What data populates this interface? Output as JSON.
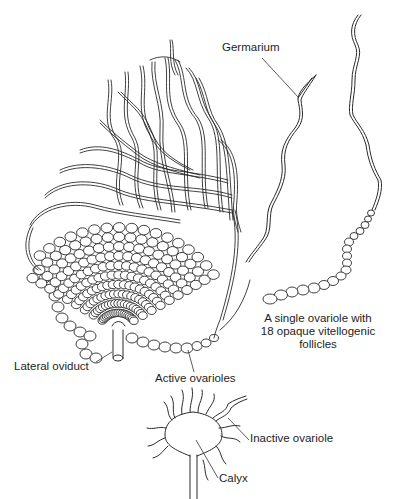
{
  "figure": {
    "type": "scientific-illustration",
    "ink_color": "#2a2a2a",
    "background": "#ffffff"
  },
  "labels": {
    "germarium": "Germarium",
    "single_ovariole": "A single ovariole with 18 opaque vitellogenic follicles",
    "lateral_oviduct": "Lateral oviduct",
    "active_ovarioles": "Active ovarioles",
    "inactive_ovariole": "Inactive ovariole",
    "calyx": "Calyx"
  },
  "parts": [
    {
      "id": "ovary-mass",
      "description": "Mature ovary with many active ovarioles converging to lateral oviduct"
    },
    {
      "id": "single-ovariole-germarium",
      "description": "Isolated ovariole, germarium tip indicated"
    },
    {
      "id": "single-ovariole-follicles",
      "description": "Isolated ovariole with 18 opaque vitellogenic follicles",
      "follicle_count": 18
    },
    {
      "id": "inactive-ovary",
      "description": "Inactive ovary: short ovarioles radiating from calyx"
    }
  ]
}
